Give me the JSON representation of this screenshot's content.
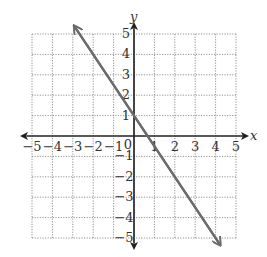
{
  "chart_data": {
    "type": "line",
    "title": "",
    "xlabel": "x",
    "ylabel": "y",
    "xlim": [
      -5,
      5
    ],
    "ylim": [
      -5,
      5
    ],
    "grid": true,
    "x_ticks": [
      "-5",
      "-4",
      "-3",
      "-2",
      "-1",
      "0",
      "1",
      "2",
      "3",
      "4",
      "5"
    ],
    "y_ticks": [
      "-5",
      "-4",
      "-3",
      "-2",
      "-1",
      "1",
      "2",
      "3",
      "4",
      "5"
    ],
    "series": [
      {
        "name": "line",
        "equation": "y = -3/2 x + 1",
        "slope": -1.5,
        "intercept": 1,
        "points": [
          [
            -2.9,
            5.35
          ],
          [
            -2,
            4
          ],
          [
            0,
            1
          ],
          [
            2,
            -2
          ],
          [
            4.2,
            -5.3
          ]
        ],
        "color": "#6b6b6b",
        "arrows": "both"
      }
    ]
  },
  "labels": {
    "x_axis": "x",
    "y_axis": "y",
    "origin": "0",
    "x_tick_labels": [
      "−5",
      "−4",
      "−3",
      "−2",
      "−1",
      "1",
      "2",
      "3",
      "4",
      "5"
    ],
    "y_tick_labels_pos": [
      "1",
      "2",
      "3",
      "4",
      "5"
    ],
    "y_tick_labels_neg": [
      "−1",
      "−2",
      "−3",
      "−4",
      "−5"
    ]
  }
}
